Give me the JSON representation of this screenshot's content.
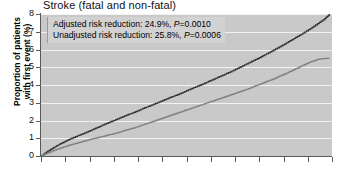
{
  "chart_data": {
    "type": "line",
    "title": "Stroke (fatal and non-fatal)",
    "ylabel": "Proportion of patients with first event (%)",
    "xlabel": "",
    "ylim": [
      0,
      8
    ],
    "yticks": [
      0,
      1,
      2,
      3,
      4,
      5,
      6,
      7,
      8
    ],
    "ytick_labels": [
      "0",
      "1",
      "2",
      "3",
      "4",
      "5",
      "6",
      "7",
      "8"
    ],
    "xlim": [
      0,
      12
    ],
    "xticks": [
      0,
      1,
      2,
      3,
      4,
      5,
      6,
      7,
      8,
      9,
      10,
      11,
      12
    ],
    "xtick_labels": [
      "",
      "",
      "",
      "",
      "",
      "",
      "",
      "",
      "",
      "",
      "",
      "",
      ""
    ],
    "grid": true,
    "grid_color": "#f2f2f2",
    "plot_background": "#c9c9c9",
    "legend": "none",
    "annotations": [
      "Adjusted risk reduction: 24.9%, P=0.0010",
      "Unadjusted risk reduction: 25.8%, P=0.0006"
    ],
    "series": [
      {
        "name": "upper-curve",
        "color": "#333333",
        "x": [
          0.0,
          0.22,
          0.45,
          0.7,
          0.95,
          1.2,
          1.5,
          1.8,
          2.1,
          2.4,
          2.7,
          3.0,
          3.3,
          3.6,
          3.9,
          4.2,
          4.5,
          4.8,
          5.1,
          5.4,
          5.7,
          6.0,
          6.3,
          6.6,
          6.9,
          7.2,
          7.5,
          7.8,
          8.1,
          8.4,
          8.7,
          9.0,
          9.3,
          9.6,
          9.9,
          10.2,
          10.5,
          10.8,
          11.1,
          11.4,
          11.7,
          11.9
        ],
        "values": [
          0.0,
          0.22,
          0.42,
          0.62,
          0.8,
          0.96,
          1.14,
          1.3,
          1.48,
          1.66,
          1.84,
          2.0,
          2.18,
          2.34,
          2.5,
          2.68,
          2.84,
          3.0,
          3.18,
          3.34,
          3.5,
          3.68,
          3.86,
          4.02,
          4.2,
          4.38,
          4.56,
          4.74,
          4.94,
          5.14,
          5.34,
          5.54,
          5.76,
          5.98,
          6.2,
          6.44,
          6.68,
          6.92,
          7.18,
          7.46,
          7.74,
          8.0
        ]
      },
      {
        "name": "lower-curve",
        "color": "#808080",
        "x": [
          0.0,
          0.22,
          0.45,
          0.7,
          0.95,
          1.2,
          1.5,
          1.8,
          2.1,
          2.4,
          2.7,
          3.0,
          3.3,
          3.6,
          3.9,
          4.2,
          4.5,
          4.8,
          5.1,
          5.4,
          5.7,
          6.0,
          6.3,
          6.6,
          6.9,
          7.2,
          7.5,
          7.8,
          8.1,
          8.4,
          8.7,
          9.0,
          9.3,
          9.6,
          9.9,
          10.2,
          10.5,
          10.8,
          11.1,
          11.4,
          11.7,
          11.9
        ],
        "values": [
          0.0,
          0.14,
          0.27,
          0.4,
          0.52,
          0.63,
          0.74,
          0.85,
          0.96,
          1.06,
          1.16,
          1.26,
          1.38,
          1.5,
          1.62,
          1.76,
          1.9,
          2.04,
          2.18,
          2.32,
          2.46,
          2.6,
          2.74,
          2.88,
          3.02,
          3.16,
          3.3,
          3.44,
          3.58,
          3.72,
          3.88,
          4.04,
          4.2,
          4.36,
          4.54,
          4.72,
          4.92,
          5.12,
          5.3,
          5.44,
          5.5,
          5.5
        ]
      }
    ]
  },
  "chart": {
    "title": "Stroke (fatal and non-fatal)",
    "ylabel_line1": "Proportion of patients",
    "ylabel_line2": "with first event (%)",
    "annotation_line1_text": "Adjusted risk reduction: 24.9%, ",
    "annotation_line1_p": "P",
    "annotation_line1_value": "=0.0010",
    "annotation_line2_text": "Unadjusted risk reduction: 25.8%, ",
    "annotation_line2_p": "P",
    "annotation_line2_value": "=0.0006"
  }
}
